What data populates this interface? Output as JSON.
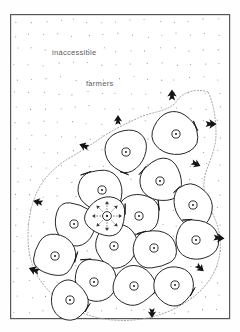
{
  "figure": {
    "background_color": "#ffffff",
    "frame": {
      "color": "#57585a",
      "x": 10,
      "y": 14,
      "width": 219,
      "height": 304
    }
  },
  "labels": [
    {
      "id": "inaccessible",
      "text": "inaccessible",
      "x": 52,
      "y": 55,
      "color": "#5d5e61"
    },
    {
      "id": "farmers",
      "text": "farmers",
      "x": 86,
      "y": 86,
      "color": "#5d5e61"
    }
  ],
  "legend_semantics": {
    "stipple_meaning": "inaccessible land occupied by farmers",
    "cell_meaning": "settlement territory",
    "circle_meaning": "settlement site",
    "black_arrow_meaning": "direction of outward expansion",
    "dashed_ray_meaning": "dispersal from founding settlement",
    "dotted_outline_meaning": "frontier of settled area"
  },
  "stipple": {
    "color": "#8e8f92",
    "spacing_x": 14.5,
    "spacing_y": 14.5,
    "radius": 0.55,
    "origin_x": 17,
    "origin_y": 22
  },
  "cells": [
    {
      "id": "cell-01",
      "cx": 176,
      "cy": 134,
      "r": 25,
      "seed": 11
    },
    {
      "id": "cell-02",
      "cx": 126,
      "cy": 152,
      "r": 24,
      "seed": 3
    },
    {
      "id": "cell-03",
      "cx": 160,
      "cy": 181,
      "r": 24,
      "seed": 7
    },
    {
      "id": "cell-04",
      "cx": 102,
      "cy": 190,
      "r": 24,
      "seed": 19
    },
    {
      "id": "cell-05",
      "cx": 139,
      "cy": 216,
      "r": 23,
      "seed": 5
    },
    {
      "id": "cell-06",
      "cx": 193,
      "cy": 205,
      "r": 23,
      "seed": 13
    },
    {
      "id": "cell-07",
      "cx": 74,
      "cy": 224,
      "r": 24,
      "seed": 23
    },
    {
      "id": "cell-08",
      "cx": 114,
      "cy": 246,
      "r": 23,
      "seed": 29
    },
    {
      "id": "cell-09",
      "cx": 154,
      "cy": 248,
      "r": 23,
      "seed": 31
    },
    {
      "id": "cell-10",
      "cx": 196,
      "cy": 240,
      "r": 23,
      "seed": 37
    },
    {
      "id": "cell-11",
      "cx": 55,
      "cy": 256,
      "r": 23,
      "seed": 41
    },
    {
      "id": "cell-12",
      "cx": 94,
      "cy": 282,
      "r": 23,
      "seed": 43
    },
    {
      "id": "cell-13",
      "cx": 134,
      "cy": 286,
      "r": 23,
      "seed": 47
    },
    {
      "id": "cell-14",
      "cx": 175,
      "cy": 285,
      "r": 23,
      "seed": 53
    },
    {
      "id": "cell-15",
      "cx": 70,
      "cy": 300,
      "r": 21,
      "seed": 59
    },
    {
      "id": "cell-16",
      "cx": 104,
      "cy": 216,
      "r": 0,
      "seed": 61
    }
  ],
  "origin_cell": {
    "id": "cell-origin",
    "cx": 107,
    "cy": 216,
    "r": 23,
    "seed": 17,
    "ray_count": 8,
    "ray_length": 15
  },
  "expansion_arrows": [
    {
      "id": "arrow-n1",
      "x": 172,
      "y": 95,
      "angle": -90,
      "size": 9
    },
    {
      "id": "arrow-n2",
      "x": 118,
      "y": 120,
      "angle": -90,
      "size": 8
    },
    {
      "id": "arrow-w1",
      "x": 84,
      "y": 146,
      "angle": 200,
      "size": 8
    },
    {
      "id": "arrow-e1",
      "x": 211,
      "y": 124,
      "angle": 0,
      "size": 9
    },
    {
      "id": "arrow-e2",
      "x": 196,
      "y": 164,
      "angle": 25,
      "size": 8
    },
    {
      "id": "arrow-w2",
      "x": 38,
      "y": 202,
      "angle": 195,
      "size": 8
    },
    {
      "id": "arrow-w3",
      "x": 34,
      "y": 270,
      "angle": 200,
      "size": 9
    },
    {
      "id": "arrow-e3",
      "x": 219,
      "y": 238,
      "angle": 5,
      "size": 9
    },
    {
      "id": "arrow-se1",
      "x": 200,
      "y": 268,
      "angle": 40,
      "size": 8
    },
    {
      "id": "arrow-s1",
      "x": 152,
      "y": 313,
      "angle": 90,
      "size": 8
    }
  ],
  "frontier_path": "M 208 92 C 196 88 182 92 176 102 C 168 112 150 112 138 118 C 126 124 116 128 104 136 C 92 144 80 152 66 160 C 54 168 44 178 38 190 C 32 202 28 218 28 236 C 28 254 32 268 40 280 C 48 292 60 302 76 310 C 92 318 112 322 134 320 C 156 318 176 310 192 298 C 208 286 218 270 220 252 C 222 234 216 220 210 208 C 204 196 202 184 206 172 C 210 160 216 148 216 134 C 216 120 214 104 208 92 Z"
}
